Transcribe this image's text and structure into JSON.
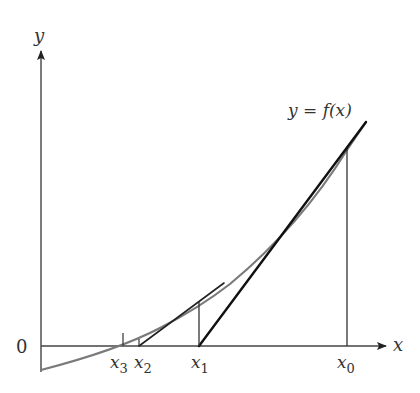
{
  "diagram": {
    "axes": {
      "x_label": "x",
      "y_label": "y",
      "origin_label": "0"
    },
    "curve_label": "y = f(x)",
    "points": [
      {
        "name": "x0",
        "base": "x",
        "sub": "0"
      },
      {
        "name": "x1",
        "base": "x",
        "sub": "1"
      },
      {
        "name": "x2",
        "base": "x",
        "sub": "2"
      },
      {
        "name": "x3",
        "base": "x",
        "sub": "3"
      }
    ],
    "colors": {
      "curve": "#7a7a7a",
      "tangent": "#111111",
      "axis": "#444444",
      "guide": "#333333"
    }
  }
}
